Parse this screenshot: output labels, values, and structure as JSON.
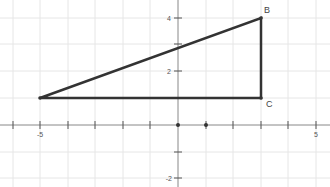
{
  "graph": {
    "x_range": [
      -6,
      5.5
    ],
    "y_range": [
      -2.3,
      4.7
    ],
    "x_tick_labels": [
      {
        "value": -5,
        "label": "-5"
      },
      {
        "value": 5,
        "label": "5"
      }
    ],
    "y_tick_labels": [
      {
        "value": 4,
        "label": "4"
      },
      {
        "value": 2,
        "label": "2"
      },
      {
        "value": -2,
        "label": "-2"
      }
    ],
    "colors": {
      "grid": "#e6e6e6",
      "axis": "#888888",
      "shape": "#333333",
      "label": "#444444"
    }
  },
  "triangle": {
    "vertices": [
      {
        "name": "A",
        "x": -5,
        "y": 1,
        "label": ""
      },
      {
        "name": "B",
        "x": 3,
        "y": 4,
        "label": "B"
      },
      {
        "name": "C",
        "x": 3,
        "y": 1,
        "label": "C"
      }
    ]
  },
  "points": [
    {
      "name": "origin",
      "x": 0,
      "y": 0
    },
    {
      "name": "point-1-0",
      "x": 1,
      "y": 0
    }
  ]
}
